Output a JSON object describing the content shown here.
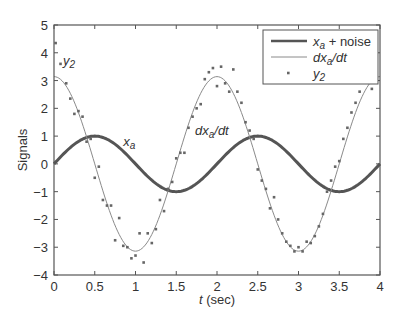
{
  "chart_data": {
    "type": "line",
    "title": "",
    "xlabel": "t (sec)",
    "xlabel_italic_part": "t",
    "xlabel_rest": " (sec)",
    "ylabel": "Signals",
    "xlim": [
      0,
      4
    ],
    "ylim": [
      -4,
      5
    ],
    "xticks": [
      0,
      0.5,
      1,
      1.5,
      2,
      2.5,
      3,
      3.5,
      4
    ],
    "xtick_labels": [
      "0",
      "0.5",
      "1",
      "1.5",
      "2",
      "2.5",
      "3",
      "3.5",
      "4"
    ],
    "yticks": [
      -4,
      -3,
      -2,
      -1,
      0,
      1,
      2,
      3,
      4,
      5
    ],
    "ytick_labels": [
      "−4",
      "−3",
      "−2",
      "−1",
      "0",
      "1",
      "2",
      "3",
      "4",
      "5"
    ],
    "grid": false,
    "legend_position": "upper right",
    "series": [
      {
        "name": "x_a + noise",
        "style": "thick-line",
        "color": "#555555",
        "width": 3,
        "formula": "sin(pi*t)",
        "x": [
          0,
          0.25,
          0.5,
          0.75,
          1,
          1.25,
          1.5,
          1.75,
          2,
          2.25,
          2.5,
          2.75,
          3,
          3.25,
          3.5,
          3.75,
          4
        ],
        "values": [
          0,
          0.71,
          1,
          0.71,
          0,
          -0.71,
          -1,
          -0.71,
          0,
          0.71,
          1,
          0.71,
          0,
          -0.71,
          -1,
          -0.71,
          0
        ]
      },
      {
        "name": "dx_a/dt",
        "style": "thin-line",
        "color": "#8a8a8a",
        "width": 1,
        "formula": "pi*cos(pi*t)",
        "x": [
          0,
          0.25,
          0.5,
          0.75,
          1,
          1.25,
          1.5,
          1.75,
          2,
          2.25,
          2.5,
          2.75,
          3,
          3.25,
          3.5,
          3.75,
          4
        ],
        "values": [
          3.14,
          2.22,
          0,
          -2.22,
          -3.14,
          -2.22,
          0,
          2.22,
          3.14,
          2.22,
          0,
          -2.22,
          -3.14,
          -2.22,
          0,
          2.22,
          3.14
        ]
      },
      {
        "name": "y_2",
        "style": "markers",
        "color": "#666666",
        "x": [
          0.02,
          0.08,
          0.15,
          0.2,
          0.25,
          0.3,
          0.35,
          0.4,
          0.45,
          0.5,
          0.55,
          0.6,
          0.65,
          0.7,
          0.75,
          0.8,
          0.85,
          0.9,
          0.95,
          1.0,
          1.05,
          1.1,
          1.15,
          1.2,
          1.25,
          1.3,
          1.35,
          1.4,
          1.45,
          1.5,
          1.55,
          1.6,
          1.65,
          1.7,
          1.75,
          1.8,
          1.85,
          1.9,
          1.95,
          2.0,
          2.05,
          2.1,
          2.15,
          2.2,
          2.25,
          2.3,
          2.35,
          2.4,
          2.45,
          2.5,
          2.55,
          2.6,
          2.65,
          2.7,
          2.75,
          2.8,
          2.85,
          2.9,
          2.95,
          3.0,
          3.05,
          3.1,
          3.15,
          3.2,
          3.25,
          3.3,
          3.35,
          3.4,
          3.45,
          3.5,
          3.55,
          3.6,
          3.65,
          3.7,
          3.75,
          3.8,
          3.85,
          3.9
        ],
        "values": [
          4.35,
          3.6,
          2.9,
          2.35,
          1.8,
          1.9,
          1.7,
          0.8,
          0.9,
          -0.5,
          -0.1,
          -1.3,
          -1.5,
          -1.5,
          -2.75,
          -1.95,
          -2.95,
          -3.0,
          -3.4,
          -3.3,
          -2.5,
          -3.55,
          -2.5,
          -2.85,
          -2.35,
          -1.3,
          -1.7,
          -0.9,
          -0.65,
          0.2,
          0.4,
          0.4,
          1.3,
          1.7,
          2.0,
          2.15,
          3.05,
          3.3,
          3.45,
          2.8,
          3.5,
          2.9,
          2.6,
          3.4,
          2.6,
          2.2,
          1.5,
          1.2,
          0.9,
          -0.2,
          -0.6,
          -0.9,
          -1.6,
          -1.2,
          -2.0,
          -2.5,
          -2.8,
          -2.95,
          -3.15,
          -3.0,
          -3.15,
          -2.8,
          -2.85,
          -2.6,
          -2.25,
          -1.8,
          -1.0,
          -0.6,
          -0.1,
          0.1,
          0.9,
          1.3,
          1.85,
          2.2,
          2.6,
          3.1,
          3.35,
          2.7
        ]
      }
    ],
    "annotations": [
      {
        "text": "y",
        "sub": "2",
        "x": 0.11,
        "y": 3.55
      },
      {
        "text": "x",
        "sub": "a",
        "x": 0.85,
        "y": 0.65
      },
      {
        "text": "dx",
        "sub": "a",
        "post": "/dt",
        "x": 1.73,
        "y": 1.05
      }
    ],
    "legend": [
      {
        "label_main": "x",
        "label_sub": "a",
        "label_post": " + noise",
        "style": "thick-line"
      },
      {
        "label_main": "dx",
        "label_sub": "a",
        "label_post": "/dt",
        "style": "thin-line"
      },
      {
        "label_main": "y",
        "label_sub": "2",
        "label_post": "",
        "style": "markers"
      }
    ]
  },
  "layout": {
    "plot_left": 54,
    "plot_right": 380,
    "plot_top": 25,
    "plot_bottom": 275,
    "axis_color": "#555555",
    "legend_box": {
      "x": 263,
      "y": 30,
      "w": 115,
      "h": 54
    }
  }
}
